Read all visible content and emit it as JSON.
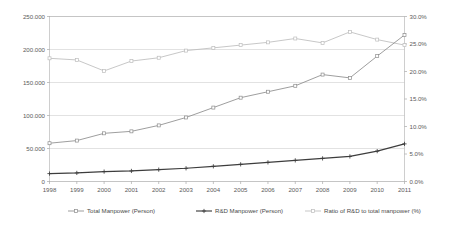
{
  "chart_data": {
    "type": "line",
    "title": "",
    "subtitle": "",
    "xlabel": "",
    "ylabel": "",
    "y2label": "",
    "categories": [
      "1998",
      "1999",
      "2000",
      "2001",
      "2002",
      "2003",
      "2004",
      "2005",
      "2006",
      "2007",
      "2008",
      "2009",
      "2010",
      "2011"
    ],
    "x": [
      1998,
      1999,
      2000,
      2001,
      2002,
      2003,
      2004,
      2005,
      2006,
      2007,
      2008,
      2009,
      2010,
      2011
    ],
    "ylim": [
      0,
      250000
    ],
    "y2lim": [
      0,
      30
    ],
    "grid": true,
    "legend_position": "bottom",
    "y_ticks": [
      "0",
      "50.000",
      "100.000",
      "150.000",
      "200.000",
      "250.000"
    ],
    "y_tick_values": [
      0,
      50000,
      100000,
      150000,
      200000,
      250000
    ],
    "y2_ticks": [
      "0.0%",
      "5.0%",
      "10.0%",
      "15.0%",
      "20.0%",
      "25.0%",
      "30.0%"
    ],
    "y2_tick_values": [
      0,
      5,
      10,
      15,
      20,
      25,
      30
    ],
    "series": [
      {
        "name": "Total Manpower (Person)",
        "axis": "left",
        "color": "#8c8c8c",
        "marker": "square",
        "values": [
          58000,
          62000,
          73000,
          76000,
          85000,
          97000,
          112000,
          127000,
          136000,
          145000,
          162000,
          157000,
          190000,
          222000
        ]
      },
      {
        "name": "R&D Manpower (Person)",
        "axis": "left",
        "color": "#3d3d3d",
        "marker": "plus",
        "values": [
          12000,
          13000,
          15000,
          16000,
          18000,
          20000,
          23000,
          26000,
          29000,
          32000,
          35000,
          38000,
          46000,
          57000
        ]
      },
      {
        "name": "Ratio of R&D to total manpower (%)",
        "axis": "right",
        "color": "#bdbdbd",
        "marker": "square",
        "values": [
          22.4,
          22.1,
          20.1,
          21.9,
          22.5,
          23.8,
          24.3,
          24.8,
          25.3,
          26.0,
          25.2,
          27.2,
          25.8,
          24.8
        ]
      }
    ],
    "legend": [
      {
        "label": "Total Manpower (Person)",
        "color": "#8c8c8c",
        "marker": "square"
      },
      {
        "label": "R&D Manpower (Person)",
        "color": "#3d3d3d",
        "marker": "plus"
      },
      {
        "label": "Ratio of R&D to total manpower (%)",
        "color": "#bdbdbd",
        "marker": "square"
      }
    ],
    "colors": {
      "background": "#ffffff",
      "grid": "#c9c9c9",
      "border": "#b9b9b9",
      "text": "#5a5a5a"
    }
  }
}
